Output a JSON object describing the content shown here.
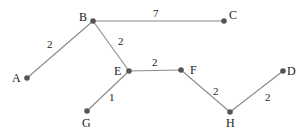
{
  "graph": {
    "nodes": [
      {
        "id": "A",
        "x": 27,
        "y": 78,
        "lx": 12,
        "ly": 82
      },
      {
        "id": "B",
        "x": 93,
        "y": 21,
        "lx": 79,
        "ly": 21
      },
      {
        "id": "C",
        "x": 224,
        "y": 21,
        "lx": 229,
        "ly": 19
      },
      {
        "id": "D",
        "x": 283,
        "y": 71,
        "lx": 287,
        "ly": 75
      },
      {
        "id": "E",
        "x": 129,
        "y": 71,
        "lx": 114,
        "ly": 75
      },
      {
        "id": "F",
        "x": 181,
        "y": 70,
        "lx": 190,
        "ly": 74
      },
      {
        "id": "G",
        "x": 87,
        "y": 111,
        "lx": 82,
        "ly": 127
      },
      {
        "id": "H",
        "x": 230,
        "y": 112,
        "lx": 226,
        "ly": 127
      }
    ],
    "edges": [
      {
        "from": "A",
        "to": "B",
        "weight": "2",
        "wx": 47,
        "wy": 48
      },
      {
        "from": "B",
        "to": "C",
        "weight": "7",
        "wx": 153,
        "wy": 17
      },
      {
        "from": "B",
        "to": "E",
        "weight": "2",
        "wx": 118,
        "wy": 45
      },
      {
        "from": "E",
        "to": "F",
        "weight": "2",
        "wx": 152,
        "wy": 66
      },
      {
        "from": "E",
        "to": "G",
        "weight": "1",
        "wx": 109,
        "wy": 101
      },
      {
        "from": "F",
        "to": "H",
        "weight": "2",
        "wx": 213,
        "wy": 95
      },
      {
        "from": "H",
        "to": "D",
        "weight": "2",
        "wx": 265,
        "wy": 101
      }
    ]
  }
}
